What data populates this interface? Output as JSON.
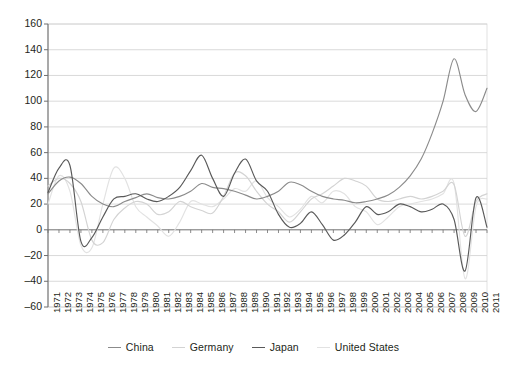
{
  "chart_data": {
    "type": "line",
    "title": "",
    "xlabel": "",
    "ylabel": "",
    "ylim": [
      -60,
      160
    ],
    "ytick_step": 20,
    "grid": true,
    "legend_position": "bottom",
    "x": [
      1971,
      1972,
      1973,
      1974,
      1975,
      1976,
      1977,
      1978,
      1979,
      1980,
      1981,
      1982,
      1983,
      1984,
      1985,
      1986,
      1987,
      1988,
      1989,
      1990,
      1991,
      1992,
      1993,
      1994,
      1995,
      1996,
      1997,
      1998,
      1999,
      2000,
      2001,
      2002,
      2003,
      2004,
      2005,
      2006,
      2007,
      2008,
      2009,
      2010,
      2011
    ],
    "yticks": [
      -60,
      -40,
      -20,
      0,
      20,
      40,
      60,
      80,
      100,
      120,
      140,
      160
    ],
    "xtick_labels": [
      "1971",
      "1972",
      "1973",
      "1974",
      "1975",
      "1976",
      "1977",
      "1978",
      "1979",
      "1980",
      "1981",
      "1982",
      "1983",
      "1984",
      "1985",
      "1986",
      "1987",
      "1988",
      "1989",
      "1990",
      "1991",
      "1992",
      "1993",
      "1994",
      "1995",
      "1996",
      "1997",
      "1998",
      "1999",
      "2000",
      "2001",
      "2002",
      "2003",
      "2004",
      "2005",
      "2006",
      "2007",
      "2008",
      "2009",
      "2010",
      "2011"
    ],
    "series": [
      {
        "name": "China",
        "color": "#8b8b8b",
        "values": [
          28,
          38,
          41,
          36,
          26,
          20,
          18,
          22,
          25,
          28,
          25,
          24,
          26,
          30,
          36,
          33,
          32,
          30,
          27,
          24,
          26,
          30,
          37,
          35,
          30,
          26,
          24,
          23,
          21,
          22,
          24,
          27,
          33,
          42,
          55,
          75,
          100,
          133,
          105,
          92,
          110
        ]
      },
      {
        "name": "Germany",
        "color": "#d3d3d3",
        "values": [
          34,
          40,
          36,
          22,
          -8,
          -10,
          8,
          17,
          22,
          20,
          12,
          14,
          22,
          18,
          15,
          13,
          26,
          44,
          42,
          30,
          20,
          14,
          6,
          14,
          24,
          28,
          34,
          40,
          38,
          34,
          24,
          22,
          24,
          26,
          24,
          26,
          30,
          35,
          -5,
          22,
          28
        ]
      },
      {
        "name": "Japan",
        "color": "#595959",
        "values": [
          29,
          48,
          50,
          -9,
          -6,
          10,
          24,
          26,
          28,
          24,
          22,
          26,
          33,
          46,
          58,
          40,
          26,
          44,
          55,
          38,
          30,
          12,
          2,
          5,
          14,
          4,
          -8,
          -4,
          6,
          18,
          12,
          14,
          20,
          18,
          14,
          16,
          20,
          8,
          -32,
          25,
          2
        ]
      },
      {
        "name": "United States",
        "color": "#e2e2e2",
        "values": [
          20,
          42,
          30,
          -12,
          -14,
          20,
          48,
          40,
          18,
          10,
          3,
          -5,
          6,
          22,
          20,
          18,
          24,
          32,
          30,
          38,
          25,
          18,
          10,
          16,
          26,
          21,
          30,
          28,
          18,
          14,
          4,
          10,
          18,
          20,
          22,
          24,
          28,
          36,
          -38,
          18,
          24
        ]
      }
    ]
  },
  "legend": {
    "items": [
      {
        "label": "China"
      },
      {
        "label": "Germany"
      },
      {
        "label": "Japan"
      },
      {
        "label": "United States"
      }
    ]
  },
  "axes": {
    "y_min_label": "-60",
    "y_max_label": "160"
  }
}
